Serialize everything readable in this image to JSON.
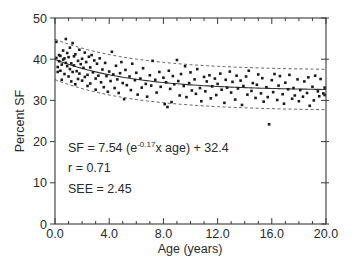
{
  "chart_data": {
    "type": "scatter",
    "title": "",
    "xlabel": "Age (years)",
    "ylabel": "Percent SF",
    "xlim": [
      0,
      20
    ],
    "ylim": [
      0,
      50
    ],
    "x_ticks": [
      "0.0",
      "4.0",
      "8.0",
      "12.0",
      "16.0",
      "20.0"
    ],
    "x_tick_values": [
      0,
      4,
      8,
      12,
      16,
      20
    ],
    "x_minor_step": 1,
    "y_ticks": [
      "0",
      "10",
      "20",
      "30",
      "40",
      "50"
    ],
    "y_tick_values": [
      0,
      10,
      20,
      30,
      40,
      50
    ],
    "y_minor_step": 5,
    "grid": false,
    "legend": null,
    "fit": {
      "equation_prefix": "SF = 7.54 (e",
      "equation_exponent": "-0.17",
      "equation_suffix": "x age) + 32.4",
      "a": 7.54,
      "b": -0.17,
      "c": 32.4,
      "r_label": "r = 0.71",
      "see_label": "SEE = 2.45",
      "band_halfwidth": 4.9,
      "line_style": "solid",
      "band_style": "dashed"
    },
    "series": [
      {
        "name": "Percent SF by age",
        "points": [
          [
            0.1,
            44.2
          ],
          [
            0.1,
            40.3
          ],
          [
            0.2,
            38.1
          ],
          [
            0.2,
            36.9
          ],
          [
            0.3,
            41.0
          ],
          [
            0.3,
            39.5
          ],
          [
            0.4,
            37.2
          ],
          [
            0.4,
            40.8
          ],
          [
            0.5,
            35.0
          ],
          [
            0.5,
            38.7
          ],
          [
            0.6,
            42.1
          ],
          [
            0.6,
            39.9
          ],
          [
            0.7,
            40.2
          ],
          [
            0.7,
            36.4
          ],
          [
            0.8,
            44.9
          ],
          [
            0.8,
            39.1
          ],
          [
            0.9,
            41.5
          ],
          [
            0.9,
            38.3
          ],
          [
            1.0,
            35.8
          ],
          [
            1.0,
            40.5
          ],
          [
            1.1,
            37.6
          ],
          [
            1.1,
            42.8
          ],
          [
            1.2,
            39.0
          ],
          [
            1.2,
            34.6
          ],
          [
            1.3,
            43.9
          ],
          [
            1.3,
            36.9
          ],
          [
            1.4,
            40.7
          ],
          [
            1.4,
            38.5
          ],
          [
            1.5,
            33.9
          ],
          [
            1.5,
            41.2
          ],
          [
            1.6,
            37.1
          ],
          [
            1.7,
            39.6
          ],
          [
            1.7,
            35.2
          ],
          [
            1.8,
            42.3
          ],
          [
            1.8,
            36.5
          ],
          [
            1.9,
            38.8
          ],
          [
            2.0,
            40.1
          ],
          [
            2.0,
            34.8
          ],
          [
            2.1,
            37.9
          ],
          [
            2.2,
            41.6
          ],
          [
            2.2,
            35.7
          ],
          [
            2.3,
            39.3
          ],
          [
            2.4,
            36.2
          ],
          [
            2.4,
            33.5
          ],
          [
            2.5,
            40.6
          ],
          [
            2.6,
            38.0
          ],
          [
            2.6,
            34.1
          ],
          [
            2.7,
            41.0
          ],
          [
            2.8,
            36.8
          ],
          [
            2.9,
            39.7
          ],
          [
            3.0,
            35.3
          ],
          [
            3.0,
            32.6
          ],
          [
            3.1,
            38.9
          ],
          [
            3.2,
            36.0
          ],
          [
            3.3,
            40.2
          ],
          [
            3.4,
            34.4
          ],
          [
            3.5,
            37.5
          ],
          [
            3.6,
            33.2
          ],
          [
            3.7,
            39.1
          ],
          [
            3.8,
            35.9
          ],
          [
            3.9,
            32.1
          ],
          [
            4.0,
            37.0
          ],
          [
            4.1,
            34.7
          ],
          [
            4.2,
            41.8
          ],
          [
            4.3,
            36.3
          ],
          [
            4.4,
            33.0
          ],
          [
            4.5,
            38.4
          ],
          [
            4.6,
            35.1
          ],
          [
            4.7,
            31.8
          ],
          [
            4.8,
            36.6
          ],
          [
            4.9,
            39.3
          ],
          [
            5.0,
            34.2
          ],
          [
            5.1,
            30.3
          ],
          [
            5.2,
            37.4
          ],
          [
            5.3,
            33.7
          ],
          [
            5.5,
            35.8
          ],
          [
            5.6,
            32.5
          ],
          [
            5.7,
            38.9
          ],
          [
            5.9,
            34.9
          ],
          [
            6.0,
            36.7
          ],
          [
            6.1,
            31.4
          ],
          [
            6.3,
            35.3
          ],
          [
            6.4,
            33.1
          ],
          [
            6.5,
            37.8
          ],
          [
            6.7,
            34.0
          ],
          [
            6.8,
            30.9
          ],
          [
            7.0,
            36.1
          ],
          [
            7.1,
            33.6
          ],
          [
            7.2,
            39.6
          ],
          [
            7.4,
            35.0
          ],
          [
            7.5,
            31.9
          ],
          [
            7.7,
            36.9
          ],
          [
            7.8,
            33.3
          ],
          [
            8.0,
            35.5
          ],
          [
            8.1,
            29.1
          ],
          [
            8.2,
            34.4
          ],
          [
            8.3,
            28.4
          ],
          [
            8.4,
            37.2
          ],
          [
            8.5,
            32.8
          ],
          [
            8.6,
            29.6
          ],
          [
            8.7,
            35.9
          ],
          [
            8.8,
            33.9
          ],
          [
            9.0,
            39.8
          ],
          [
            9.1,
            34.7
          ],
          [
            9.2,
            31.2
          ],
          [
            9.3,
            36.4
          ],
          [
            9.5,
            33.5
          ],
          [
            9.6,
            38.3
          ],
          [
            9.7,
            30.8
          ],
          [
            9.9,
            34.2
          ],
          [
            10.0,
            36.8
          ],
          [
            10.1,
            32.4
          ],
          [
            10.3,
            35.1
          ],
          [
            10.4,
            31.6
          ],
          [
            10.5,
            37.6
          ],
          [
            10.7,
            33.0
          ],
          [
            10.8,
            29.8
          ],
          [
            11.0,
            35.7
          ],
          [
            11.1,
            32.2
          ],
          [
            11.2,
            34.6
          ],
          [
            11.4,
            36.1
          ],
          [
            11.5,
            30.5
          ],
          [
            11.6,
            33.4
          ],
          [
            11.8,
            35.3
          ],
          [
            11.9,
            31.3
          ],
          [
            12.0,
            34.0
          ],
          [
            12.2,
            36.5
          ],
          [
            12.3,
            32.6
          ],
          [
            12.5,
            29.4
          ],
          [
            12.6,
            35.0
          ],
          [
            12.7,
            33.1
          ],
          [
            12.9,
            37.0
          ],
          [
            13.0,
            31.9
          ],
          [
            13.1,
            34.5
          ],
          [
            13.3,
            30.2
          ],
          [
            13.4,
            36.0
          ],
          [
            13.5,
            32.9
          ],
          [
            13.7,
            34.8
          ],
          [
            13.8,
            28.9
          ],
          [
            13.9,
            33.5
          ],
          [
            14.1,
            35.8
          ],
          [
            14.2,
            31.4
          ],
          [
            14.3,
            37.2
          ],
          [
            14.5,
            32.3
          ],
          [
            14.6,
            34.2
          ],
          [
            14.8,
            30.6
          ],
          [
            14.9,
            33.8
          ],
          [
            15.0,
            36.3
          ],
          [
            15.2,
            31.7
          ],
          [
            15.3,
            35.4
          ],
          [
            15.4,
            29.7
          ],
          [
            15.6,
            33.2
          ],
          [
            15.7,
            30.8
          ],
          [
            15.8,
            24.2
          ],
          [
            16.0,
            34.9
          ],
          [
            16.1,
            32.0
          ],
          [
            16.2,
            36.4
          ],
          [
            16.4,
            30.1
          ],
          [
            16.5,
            33.6
          ],
          [
            16.6,
            35.9
          ],
          [
            16.8,
            31.5
          ],
          [
            16.9,
            29.2
          ],
          [
            17.0,
            34.3
          ],
          [
            17.2,
            32.7
          ],
          [
            17.3,
            36.2
          ],
          [
            17.5,
            30.4
          ],
          [
            17.6,
            33.0
          ],
          [
            17.7,
            31.2
          ],
          [
            17.9,
            35.1
          ],
          [
            18.0,
            29.8
          ],
          [
            18.1,
            32.5
          ],
          [
            18.3,
            30.9
          ],
          [
            18.4,
            34.6
          ],
          [
            18.6,
            31.8
          ],
          [
            18.7,
            35.6
          ],
          [
            18.8,
            28.7
          ],
          [
            19.0,
            33.3
          ],
          [
            19.1,
            30.0
          ],
          [
            19.2,
            36.0
          ],
          [
            19.4,
            32.2
          ],
          [
            19.5,
            31.0
          ],
          [
            19.6,
            35.2
          ],
          [
            19.8,
            31.7
          ],
          [
            19.9,
            31.3
          ],
          [
            19.9,
            33.1
          ]
        ]
      }
    ]
  }
}
